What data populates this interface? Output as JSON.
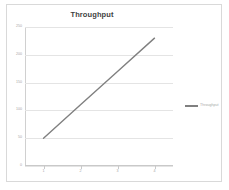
{
  "chart_data": {
    "type": "line",
    "title": "Throughput",
    "xlabel": "",
    "ylabel": "",
    "categories": [
      "1",
      "2",
      "3",
      "4"
    ],
    "series": [
      {
        "name": "Throughput",
        "values": [
          50,
          110,
          170,
          230
        ]
      }
    ],
    "ylim": [
      0,
      250
    ],
    "yticks": [
      0,
      50,
      100,
      150,
      200,
      250
    ],
    "ytick_labels": [
      "0",
      "50",
      "100",
      "150",
      "200",
      "250"
    ],
    "grid": true,
    "legend_position": "right",
    "line_color": "#808080",
    "gridline_color": "#e4e4e4",
    "axis_color": "#c9c9c9",
    "tick_label_color": "#a6a6a6",
    "title_color": "#3f3f3f",
    "border_color": "#d9d9d9",
    "background": "#ffffff"
  },
  "legend": {
    "entries": [
      {
        "label": "Throughput",
        "color": "#808080"
      }
    ]
  }
}
